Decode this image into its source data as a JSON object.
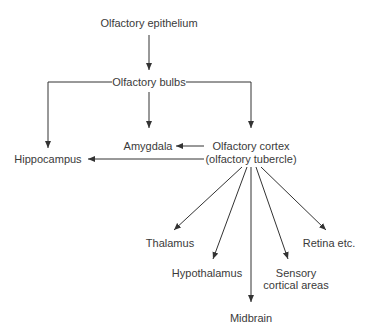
{
  "diagram": {
    "type": "flowchart",
    "nodes": {
      "epithelium": "Olfactory epithelium",
      "bulbs": "Olfactory bulbs",
      "amygdala": "Amygdala",
      "cortex_line1": "Olfactory cortex",
      "cortex_line2": "(olfactory tubercle)",
      "hippocampus": "Hippocampus",
      "thalamus": "Thalamus",
      "hypothalamus": "Hypothalamus",
      "midbrain": "Midbrain",
      "sensory_line1": "Sensory",
      "sensory_line2": "cortical areas",
      "retina": "Retina etc."
    },
    "edges": [
      [
        "Olfactory epithelium",
        "Olfactory bulbs"
      ],
      [
        "Olfactory bulbs",
        "Hippocampus"
      ],
      [
        "Olfactory bulbs",
        "Amygdala"
      ],
      [
        "Olfactory bulbs",
        "Olfactory cortex (olfactory tubercle)"
      ],
      [
        "Olfactory cortex (olfactory tubercle)",
        "Amygdala"
      ],
      [
        "Olfactory cortex (olfactory tubercle)",
        "Hippocampus"
      ],
      [
        "Olfactory cortex (olfactory tubercle)",
        "Thalamus"
      ],
      [
        "Olfactory cortex (olfactory tubercle)",
        "Hypothalamus"
      ],
      [
        "Olfactory cortex (olfactory tubercle)",
        "Midbrain"
      ],
      [
        "Olfactory cortex (olfactory tubercle)",
        "Sensory cortical areas"
      ],
      [
        "Olfactory cortex (olfactory tubercle)",
        "Retina etc."
      ]
    ],
    "colors": {
      "line": "#333333",
      "text": "#3a3a3a",
      "background": "#ffffff"
    }
  }
}
